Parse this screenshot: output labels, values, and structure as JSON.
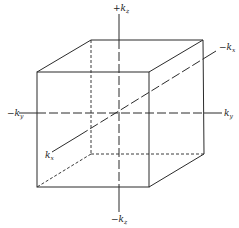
{
  "diagram": {
    "type": "3d-cube-reciprocal-space",
    "labels": {
      "kz_pos": {
        "sign": "+",
        "base": "k",
        "sub": "z"
      },
      "kz_neg": {
        "sign": "−",
        "base": "k",
        "sub": "z"
      },
      "ky_pos": {
        "sign": "",
        "base": "k",
        "sub": "y"
      },
      "ky_neg": {
        "sign": "−",
        "base": "k",
        "sub": "y"
      },
      "kx_pos": {
        "sign": "",
        "base": "k",
        "sub": "x"
      },
      "kx_neg": {
        "sign": "−",
        "base": "k",
        "sub": "x"
      }
    },
    "colors": {
      "line": "#2b2b2b",
      "background": "#ffffff"
    }
  }
}
